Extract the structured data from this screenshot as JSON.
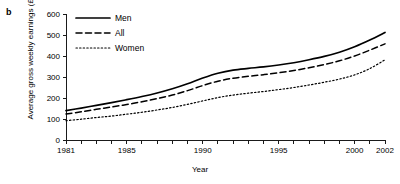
{
  "panel": {
    "label": "b"
  },
  "chart_data": {
    "type": "line",
    "title": "",
    "xlabel": "Year",
    "ylabel": "Average gross weekly earnings (£)",
    "xlim": [
      1981,
      2002
    ],
    "ylim": [
      0,
      600
    ],
    "grid": false,
    "legend_position": "top-left",
    "y_ticks": [
      0,
      100,
      200,
      300,
      400,
      500,
      600
    ],
    "y_tick_labels": [
      "0",
      "100",
      "200",
      "300",
      "400",
      "500",
      "600"
    ],
    "x_ticks": [
      1981,
      1982,
      1983,
      1984,
      1985,
      1986,
      1987,
      1988,
      1989,
      1990,
      1991,
      1992,
      1993,
      1994,
      1995,
      1996,
      1997,
      1998,
      1999,
      2000,
      2001,
      2002
    ],
    "x_tick_labels_shown": [
      "1981",
      "1985",
      "1990",
      "1995",
      "2000",
      "2002"
    ],
    "x": [
      1981,
      1982,
      1983,
      1984,
      1985,
      1986,
      1987,
      1988,
      1989,
      1990,
      1991,
      1992,
      1993,
      1994,
      1995,
      1996,
      1997,
      1998,
      1999,
      2000,
      2001,
      2002
    ],
    "series": [
      {
        "name": "Men",
        "style": "solid",
        "color": "#000000",
        "values": [
          140,
          152,
          165,
          178,
          192,
          207,
          224,
          244,
          268,
          295,
          318,
          333,
          341,
          348,
          357,
          368,
          382,
          398,
          418,
          444,
          476,
          512
        ]
      },
      {
        "name": "All",
        "style": "dashed",
        "color": "#000000",
        "values": [
          124,
          134,
          146,
          157,
          169,
          182,
          197,
          214,
          235,
          259,
          280,
          294,
          303,
          311,
          320,
          331,
          344,
          359,
          377,
          400,
          428,
          458
        ]
      },
      {
        "name": "Women",
        "style": "dotted",
        "color": "#000000",
        "values": [
          92,
          99,
          107,
          114,
          123,
          132,
          143,
          155,
          170,
          186,
          202,
          214,
          223,
          231,
          240,
          250,
          262,
          275,
          290,
          310,
          340,
          382
        ]
      }
    ]
  }
}
